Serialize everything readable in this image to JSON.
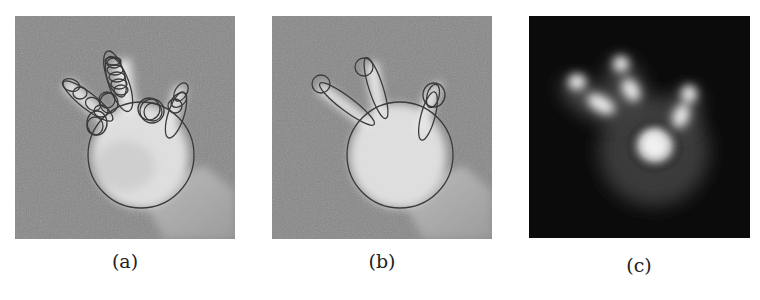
{
  "figure": {
    "panels": [
      {
        "id": "a",
        "caption": "(a)",
        "description": "Grayscale hand image with many overlapping ellipse fits on fingers and a large circle on the palm",
        "background": "#8a8a8a",
        "overlay_color": "#3a3a3a"
      },
      {
        "id": "b",
        "caption": "(b)",
        "description": "Grayscale hand image with three finger ellipses, small fingertip circles, and a large palm circle",
        "background": "#8a8a8a",
        "overlay_color": "#3a3a3a"
      },
      {
        "id": "c",
        "caption": "(c)",
        "description": "Blurred density map of the hand model on black background: bright palm blob and four finger blobs",
        "background": "#0a0a0a",
        "highlight_color": "#f5f5f5"
      }
    ]
  }
}
